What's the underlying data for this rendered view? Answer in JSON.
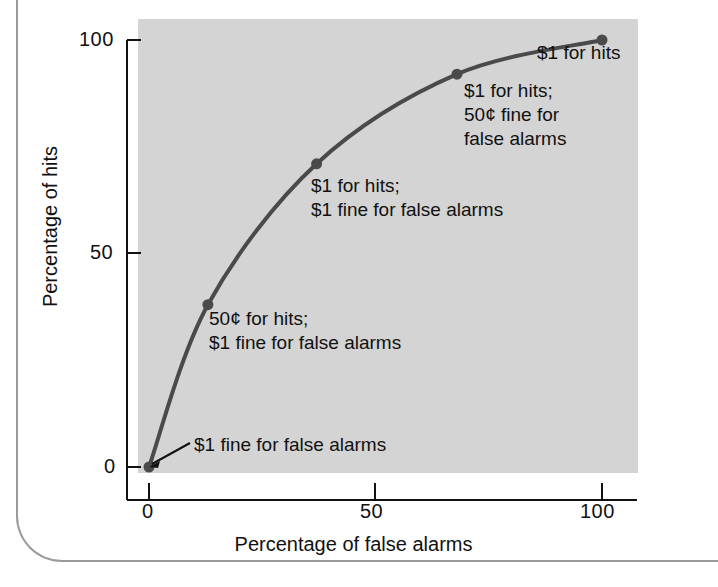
{
  "figure": {
    "panel_color": "#d4d4d4",
    "line_color": "#4a4a4a",
    "point_color": "#4a4a4a",
    "axis_color": "#111111",
    "page_border_color": "#9a9a9a"
  },
  "chart_data": {
    "type": "line",
    "title": "",
    "xlabel": "Percentage of false alarms",
    "ylabel": "Percentage of hits",
    "xlim": [
      0,
      100
    ],
    "ylim": [
      0,
      100
    ],
    "xticks": [
      "0",
      "50",
      "100"
    ],
    "yticks": [
      "0",
      "50",
      "100"
    ],
    "xtick_values": [
      0,
      50,
      100
    ],
    "ytick_values": [
      0,
      50,
      100
    ],
    "grid": false,
    "legend": "none",
    "series": [
      {
        "name": "ROC curve",
        "x": [
          0,
          13,
          37,
          68,
          100
        ],
        "y": [
          0,
          38,
          71,
          92,
          100
        ]
      }
    ],
    "annotations": [
      {
        "text": "$1 fine for false alarms",
        "point_x": 0,
        "point_y": 0,
        "leader": true
      },
      {
        "text": "50¢ for hits;\n$1 fine for false alarms",
        "point_x": 13,
        "point_y": 38,
        "leader": false
      },
      {
        "text": "$1 for hits;\n$1 fine for false alarms",
        "point_x": 37,
        "point_y": 71,
        "leader": false
      },
      {
        "text": "$1 for hits;\n50¢ fine for\nfalse alarms",
        "point_x": 68,
        "point_y": 92,
        "leader": false
      },
      {
        "text": "$1 for hits",
        "point_x": 100,
        "point_y": 100,
        "leader": false
      }
    ]
  }
}
